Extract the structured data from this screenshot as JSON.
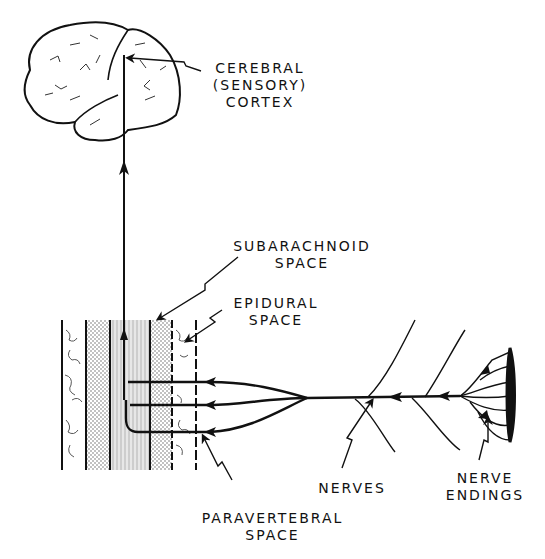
{
  "diagram": {
    "colors": {
      "ink": "#111111",
      "background": "#ffffff",
      "stipple": "#555555"
    },
    "labels": {
      "cortex": {
        "line1": "CEREBRAL",
        "line2": "(SENSORY)",
        "line3": "CORTEX"
      },
      "subarachnoid": {
        "line1": "SUBARACHNOID",
        "line2": "SPACE"
      },
      "epidural": {
        "line1": "EPIDURAL",
        "line2": "SPACE"
      },
      "paravertebral": {
        "line1": "PARAVERTEBRAL",
        "line2": "SPACE"
      },
      "nerves": {
        "line1": "NERVES"
      },
      "nerve_endings": {
        "line1": "NERVE",
        "line2": "ENDINGS"
      }
    },
    "nodes": [
      "brain",
      "spinal-column",
      "spinal-cord",
      "nerve-roots",
      "peripheral-nerve",
      "nerve-endings",
      "skin-surface"
    ],
    "edges": [
      {
        "from": "nerve-endings",
        "to": "peripheral-nerve"
      },
      {
        "from": "peripheral-nerve",
        "to": "nerve-roots"
      },
      {
        "from": "nerve-roots",
        "to": "spinal-cord"
      },
      {
        "from": "spinal-cord",
        "to": "brain"
      }
    ]
  }
}
